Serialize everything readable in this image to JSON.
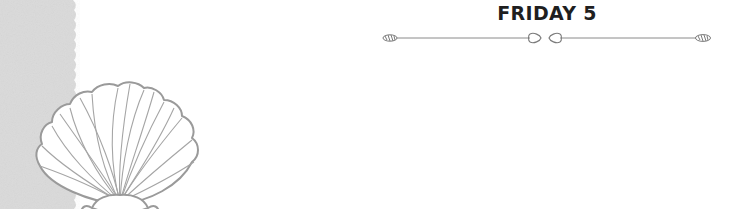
{
  "header": {
    "title": "FRIDAY 5"
  },
  "decor": {
    "left_strip": "scalloped-grey-paper-strip",
    "shell": "scallop-shell-outline",
    "divider": "arrow-heart-divider"
  },
  "colors": {
    "strip": "#d9d9d9",
    "shell_stroke": "#9a9a9a",
    "divider_stroke": "#7a7a7a",
    "title": "#1f1f1f"
  }
}
